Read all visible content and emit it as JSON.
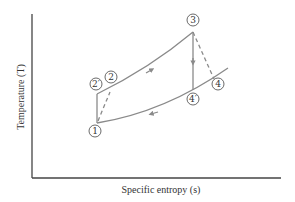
{
  "diagram": {
    "type": "T-s diagram (Brayton cycle)",
    "axes": {
      "x_label": "Specific entropy (s)",
      "y_label": "Temperature (T)"
    },
    "states": [
      {
        "id": "1",
        "label": "1"
      },
      {
        "id": "2p",
        "label": "2′"
      },
      {
        "id": "2",
        "label": "2"
      },
      {
        "id": "3",
        "label": "3"
      },
      {
        "id": "4",
        "label": "4"
      },
      {
        "id": "4p",
        "label": "4′"
      }
    ],
    "processes": [
      {
        "from": "1",
        "to": "2′",
        "style": "solid",
        "desc": "isentropic compression"
      },
      {
        "from": "1",
        "to": "2",
        "style": "dashed",
        "desc": "actual compression"
      },
      {
        "from": "2",
        "to": "3",
        "style": "solid",
        "desc": "constant-pressure heat addition"
      },
      {
        "from": "3",
        "to": "4′",
        "style": "solid",
        "desc": "isentropic expansion"
      },
      {
        "from": "3",
        "to": "4",
        "style": "dashed",
        "desc": "actual expansion"
      },
      {
        "from": "4",
        "to": "1",
        "style": "solid",
        "desc": "constant-pressure heat rejection"
      }
    ],
    "colors": {
      "axis": "#444444",
      "curve": "#8a8a8a",
      "text": "#333333"
    }
  }
}
